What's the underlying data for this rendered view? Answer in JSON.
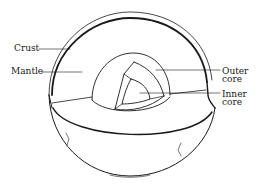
{
  "diagram": {
    "labels": {
      "crust": "Crust",
      "mantle": "Mantle",
      "outer_core_line1": "Outer",
      "outer_core_line2": "core",
      "inner_core_line1": "Inner",
      "inner_core_line2": "core"
    },
    "colors": {
      "line": "#1a1a1a",
      "background": "#ffffff"
    }
  }
}
